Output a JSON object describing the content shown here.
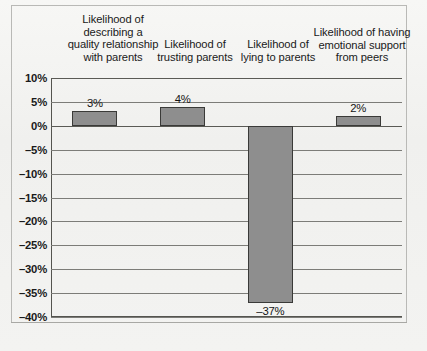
{
  "chart_data": {
    "type": "bar",
    "title": "",
    "xlabel": "",
    "ylabel": "",
    "categories": [
      "Likelihood of\ndescribing a\nquality relationship\nwith parents",
      "Likelihood of\ntrusting parents",
      "Likelihood of\nlying to parents",
      "Likelihood of having\nemotional support\nfrom peers"
    ],
    "values": [
      3,
      4,
      -37,
      2
    ],
    "value_labels": [
      "3%",
      "4%",
      "–37%",
      "2%"
    ],
    "ylim": [
      -40,
      10
    ],
    "ytick_values": [
      10,
      5,
      0,
      -5,
      -10,
      -15,
      -20,
      -25,
      -30,
      -35,
      -40
    ],
    "ytick_labels": [
      "10%",
      "5%",
      "0%",
      "–5%",
      "–10%",
      "–15%",
      "–20%",
      "–25%",
      "–30%",
      "–35%",
      "–40%"
    ],
    "grid": true,
    "legend": false,
    "legend_position": "none",
    "bar_color": "#8e8e8e",
    "bar_border_color": "#3a3a38",
    "axis_color": "#54544f",
    "gridline_color": "#7c7c78",
    "background_color": "#f2f2f0"
  }
}
